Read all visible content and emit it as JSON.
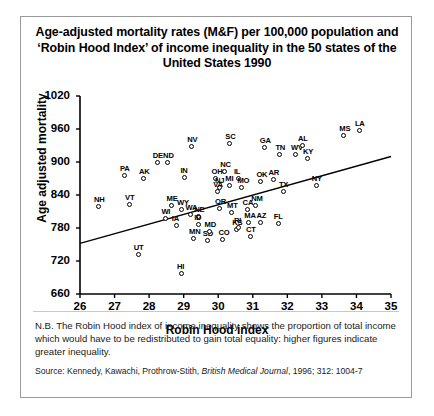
{
  "figure": {
    "title": "Age-adjusted mortality rates (M&F) per 100,000 population and ‘Robin Hood Index’ of income inequality in the 50 states of the United States 1990",
    "note": "N.B. The Robin Hood index of income inequality shows the proportion of total income which would have to be redistributed to gain total equality: higher figures indicate greater inequality.",
    "source": "Source: Kennedy, Kawachi, Prothrow-Stith, British Medical Journal, 1996; 312: 1004-7",
    "source_prefix": "Source: Kennedy, Kawachi, Prothrow-Stith, ",
    "source_italic": "British Medical Journal",
    "source_suffix": ", 1996; 312: 1004-7"
  },
  "chart_data": {
    "type": "scatter",
    "title": "Age-adjusted mortality rates (M&F) per 100,000 population and ‘Robin Hood Index’ of income inequality in the 50 states of the United States 1990",
    "xlabel": "Robin Hood index",
    "ylabel": "Age adjusted mortality",
    "xlim": [
      26,
      35
    ],
    "ylim": [
      660,
      1020
    ],
    "xticks": [
      26,
      27,
      28,
      29,
      30,
      31,
      32,
      33,
      34,
      35
    ],
    "yticks": [
      660,
      720,
      780,
      840,
      900,
      960,
      1020
    ],
    "grid": false,
    "legend": null,
    "trendline": {
      "x1": 26.0,
      "y1": 752,
      "x2": 35.0,
      "y2": 910
    },
    "point_label_field": "state",
    "points": [
      {
        "state": "NH",
        "x": 26.55,
        "y": 819
      },
      {
        "state": "PA",
        "x": 27.3,
        "y": 874
      },
      {
        "state": "VT",
        "x": 27.45,
        "y": 821
      },
      {
        "state": "UT",
        "x": 27.7,
        "y": 731
      },
      {
        "state": "AK",
        "x": 27.85,
        "y": 870
      },
      {
        "state": "DE",
        "x": 28.25,
        "y": 898
      },
      {
        "state": "ND",
        "x": 28.55,
        "y": 899
      },
      {
        "state": "WI",
        "x": 28.5,
        "y": 797
      },
      {
        "state": "ME",
        "x": 28.65,
        "y": 820
      },
      {
        "state": "WY",
        "x": 28.95,
        "y": 813
      },
      {
        "state": "IA",
        "x": 28.8,
        "y": 784
      },
      {
        "state": "HI",
        "x": 28.95,
        "y": 696
      },
      {
        "state": "IN",
        "x": 29.05,
        "y": 871
      },
      {
        "state": "NV",
        "x": 29.25,
        "y": 928
      },
      {
        "state": "WA",
        "x": 29.2,
        "y": 804
      },
      {
        "state": "NE",
        "x": 29.45,
        "y": 800
      },
      {
        "state": "ID",
        "x": 29.45,
        "y": 785
      },
      {
        "state": "MN",
        "x": 29.3,
        "y": 760
      },
      {
        "state": "SD",
        "x": 29.7,
        "y": 757
      },
      {
        "state": "MD",
        "x": 29.75,
        "y": 773
      },
      {
        "state": "OH",
        "x": 29.95,
        "y": 869
      },
      {
        "state": "NC",
        "x": 30.2,
        "y": 882
      },
      {
        "state": "NJ",
        "x": 30.05,
        "y": 852
      },
      {
        "state": "MI",
        "x": 30.35,
        "y": 856
      },
      {
        "state": "OR",
        "x": 30.05,
        "y": 814
      },
      {
        "state": "MT",
        "x": 30.4,
        "y": 808
      },
      {
        "state": "CO",
        "x": 30.15,
        "y": 759
      },
      {
        "state": "IL",
        "x": 30.6,
        "y": 869
      },
      {
        "state": "MO",
        "x": 30.7,
        "y": 853
      },
      {
        "state": "SC",
        "x": 30.35,
        "y": 932
      },
      {
        "state": "KS",
        "x": 30.55,
        "y": 776
      },
      {
        "state": "CT",
        "x": 30.95,
        "y": 763
      },
      {
        "state": "MA",
        "x": 30.9,
        "y": 789
      },
      {
        "state": "CA",
        "x": 30.85,
        "y": 812
      },
      {
        "state": "AZ",
        "x": 31.25,
        "y": 789
      },
      {
        "state": "OK",
        "x": 31.25,
        "y": 864
      },
      {
        "state": "GA",
        "x": 31.35,
        "y": 926
      },
      {
        "state": "AR",
        "x": 31.6,
        "y": 868
      },
      {
        "state": "FL",
        "x": 31.75,
        "y": 787
      },
      {
        "state": "TN",
        "x": 31.8,
        "y": 913
      },
      {
        "state": "TX",
        "x": 31.9,
        "y": 846
      },
      {
        "state": "WV",
        "x": 32.25,
        "y": 913
      },
      {
        "state": "AL",
        "x": 32.45,
        "y": 930
      },
      {
        "state": "KY",
        "x": 32.6,
        "y": 905
      },
      {
        "state": "NY",
        "x": 32.85,
        "y": 856
      },
      {
        "state": "MS",
        "x": 33.65,
        "y": 948
      },
      {
        "state": "LA",
        "x": 34.1,
        "y": 957
      },
      {
        "state": "VA",
        "x": 30.0,
        "y": 845
      },
      {
        "state": "RI",
        "x": 30.6,
        "y": 780
      },
      {
        "state": "NM",
        "x": 31.1,
        "y": 820
      }
    ]
  }
}
